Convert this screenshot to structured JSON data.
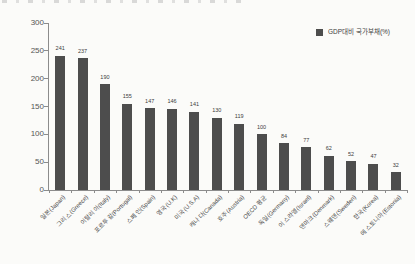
{
  "page": {
    "background": "#fbfbf9"
  },
  "chart_data": {
    "type": "bar",
    "title": "",
    "legend_label": "GDP대비 국가부채(%)",
    "legend_position": "top-right",
    "categories": [
      "일본(Japan)",
      "그리스(Greece)",
      "이탈리아(Italy)",
      "포르투갈(Portugal)",
      "스페인(Spain)",
      "영국(U.K)",
      "미국(U.S.A)",
      "캐나다(Canada)",
      "호주(Austria)",
      "OECD 평균",
      "독일(Germany)",
      "이스라엘(Israel)",
      "덴마크(Denmark)",
      "스웨덴(Sweden)",
      "한국(Korea)",
      "에스토니아(Estonia)"
    ],
    "values": [
      241,
      237,
      190,
      155,
      147,
      146,
      141,
      130,
      119,
      100,
      84,
      77,
      62,
      52,
      47,
      32
    ],
    "value_labels_shown": true,
    "xlabel": "",
    "ylabel": "",
    "ylim": [
      0,
      300
    ],
    "y_ticks": [
      0,
      50,
      100,
      150,
      200,
      250,
      300
    ],
    "grid": false,
    "bar_color": "#4d4d4d",
    "axis_color": "#8c8c8c",
    "text_color": "#4a4a4a"
  }
}
